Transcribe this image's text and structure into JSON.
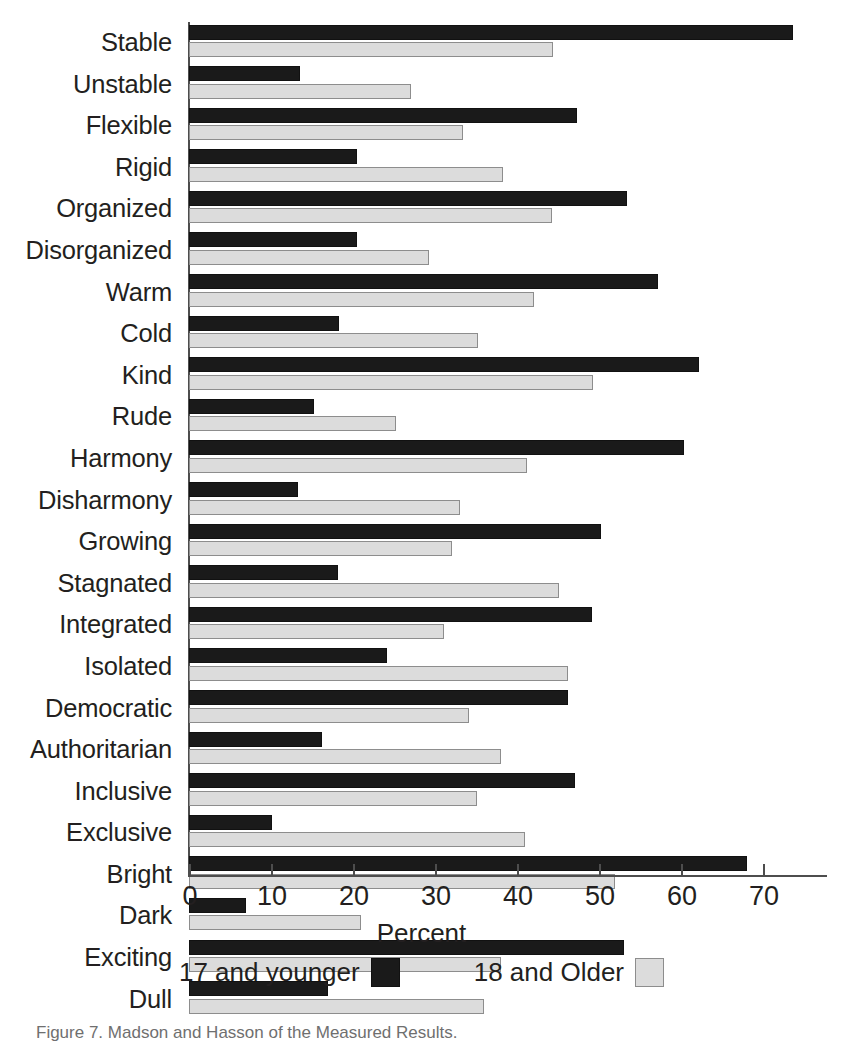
{
  "chart_data": {
    "type": "bar",
    "orientation": "horizontal",
    "title": "",
    "xlabel": "Percent",
    "ylabel": "",
    "xlim": [
      0,
      78
    ],
    "xticks": [
      0,
      10,
      20,
      30,
      40,
      50,
      60,
      70
    ],
    "xtick_labels": [
      "0",
      "10",
      "20",
      "30",
      "40",
      "50",
      "60",
      "70"
    ],
    "grid": false,
    "legend_position": "bottom",
    "categories": [
      "Stable",
      "Unstable",
      "Flexible",
      "Rigid",
      "Organized",
      "Disorganized",
      "Warm",
      "Cold",
      "Kind",
      "Rude",
      "Harmony",
      "Disharmony",
      "Growing",
      "Stagnated",
      "Integrated",
      "Isolated",
      "Democratic",
      "Authoritarian",
      "Inclusive",
      "Exclusive",
      "Bright",
      "Dark",
      "Exciting",
      "Dull"
    ],
    "series": [
      {
        "name": "17 and younger",
        "color": "#1a1a1a",
        "values": [
          73.7,
          13.5,
          47.3,
          20.5,
          53.4,
          20.5,
          57.2,
          18.3,
          62.2,
          15.2,
          60.4,
          13.3,
          50.3,
          18.2,
          49.2,
          24.1,
          46.2,
          16.2,
          47.1,
          10.1,
          68.0,
          7.0,
          53.0,
          17.0
        ]
      },
      {
        "name": "18 and Older",
        "color": "#dcdcdc",
        "values": [
          44.4,
          27.1,
          33.4,
          38.3,
          44.3,
          29.3,
          42.1,
          35.2,
          49.3,
          25.2,
          41.2,
          33.1,
          32.1,
          45.1,
          31.1,
          46.2,
          34.1,
          38.1,
          35.1,
          41.0,
          52.0,
          21.0,
          38.0,
          36.0
        ]
      }
    ]
  },
  "legend": {
    "items": [
      {
        "label": "17 and younger",
        "swatch": "black"
      },
      {
        "label": "18 and Older",
        "swatch": "gray"
      }
    ]
  },
  "caption": {
    "text": "Figure 7. Madson and Hasson of the Measured Results."
  }
}
